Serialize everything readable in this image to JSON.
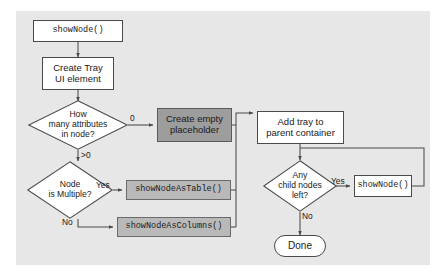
{
  "diagram": {
    "background": "#e7e7e7",
    "page_background": "#ffffff",
    "colors": {
      "stroke": "#4a4a4a",
      "node_fill_white": "#ffffff",
      "node_fill_dark_gray": "#9d9d9d",
      "node_fill_light_gray": "#b9b9b9",
      "text": "#1a1a1a"
    },
    "nodes": {
      "start": {
        "label": "showNode()",
        "type": "process-mono",
        "fill": "#ffffff"
      },
      "create_tray": {
        "label_line1": "Create Tray",
        "label_line2": "UI element",
        "type": "process",
        "fill": "#ffffff"
      },
      "how_many_attributes": {
        "label_line1": "How",
        "label_line2": "many attributes",
        "label_line3": "in node?",
        "type": "decision",
        "fill": "#ffffff"
      },
      "node_is_multiple": {
        "label_line1": "Node",
        "label_line2": "is Multiple?",
        "type": "decision",
        "fill": "#ffffff"
      },
      "create_empty_placeholder": {
        "label_line1": "Create empty",
        "label_line2": "placeholder",
        "type": "process",
        "fill": "#9d9d9d"
      },
      "show_node_as_table": {
        "label": "showNodeAsTable()",
        "type": "process-mono",
        "fill": "#b9b9b9"
      },
      "show_node_as_columns": {
        "label": "showNodeAsColumns()",
        "type": "process-mono",
        "fill": "#b9b9b9"
      },
      "add_tray_to_parent": {
        "label_line1": "Add tray to",
        "label_line2": "parent container",
        "type": "process",
        "fill": "#ffffff"
      },
      "any_child_nodes_left": {
        "label_line1": "Any",
        "label_line2": "child nodes",
        "label_line3": "left?",
        "type": "decision",
        "fill": "#ffffff"
      },
      "recurse_show_node": {
        "label": "showNode()",
        "type": "process-mono",
        "fill": "#ffffff"
      },
      "done": {
        "label": "Done",
        "type": "terminal",
        "fill": "#ffffff"
      }
    },
    "edge_labels": {
      "attributes_zero": "0",
      "attributes_gt_zero": ">0",
      "multiple_yes": "Yes",
      "multiple_no": "No",
      "children_yes": "Yes",
      "children_no": "No"
    }
  }
}
